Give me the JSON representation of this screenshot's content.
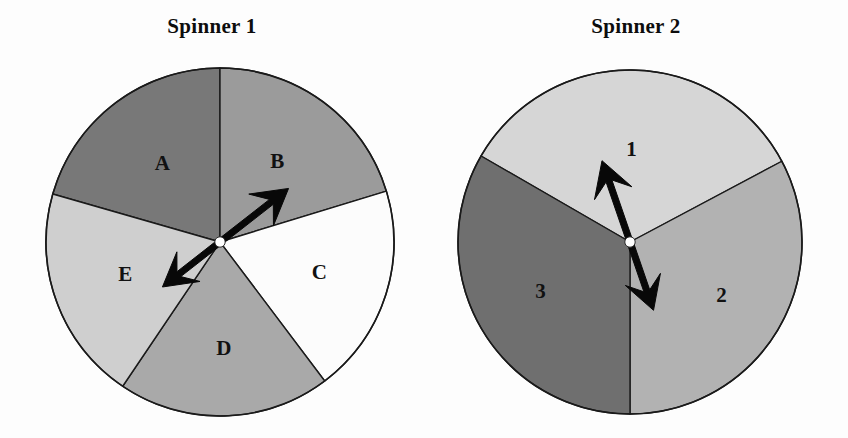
{
  "page": {
    "background_color": "#fdfdfd",
    "width": 848,
    "height": 438
  },
  "spinners": [
    {
      "id": "spinner-1",
      "title": "Spinner 1",
      "center": {
        "x": 220,
        "y": 242
      },
      "radius": 174,
      "outline_color": "#1a1a1a",
      "pointer": {
        "type": "double-headed-arrow",
        "head_angle_deg": -38,
        "tail_angle_deg": 142,
        "color": "#080808",
        "hub_color": "#ffffff"
      },
      "sectors": [
        {
          "label": "A",
          "start_deg": -90,
          "end_deg": -164,
          "fill": "#787878",
          "label_r": 0.55,
          "label_angle_deg": -127
        },
        {
          "label": "B",
          "start_deg": -90,
          "end_deg": -17,
          "fill": "#9b9b9b",
          "label_r": 0.56,
          "label_angle_deg": -54
        },
        {
          "label": "C",
          "start_deg": -17,
          "end_deg": 53,
          "fill": "#fcfcfc",
          "label_r": 0.6,
          "label_angle_deg": 18
        },
        {
          "label": "D",
          "start_deg": 53,
          "end_deg": 124,
          "fill": "#a9a9a9",
          "label_r": 0.62,
          "label_angle_deg": 88
        },
        {
          "label": "E",
          "start_deg": 124,
          "end_deg": 196,
          "fill": "#cfcfcf",
          "label_r": 0.58,
          "label_angle_deg": 160
        }
      ]
    },
    {
      "id": "spinner-2",
      "title": "Spinner 2",
      "center": {
        "x": 206,
        "y": 242
      },
      "radius": 172,
      "outline_color": "#1a1a1a",
      "pointer": {
        "type": "double-headed-arrow",
        "head_angle_deg": -109,
        "tail_angle_deg": 71,
        "color": "#080808",
        "hub_color": "#ffffff"
      },
      "sectors": [
        {
          "label": "1",
          "start_deg": -150,
          "end_deg": -28,
          "fill": "#d6d6d6",
          "label_r": 0.53,
          "label_angle_deg": -89
        },
        {
          "label": "2",
          "start_deg": -28,
          "end_deg": 90,
          "fill": "#b2b2b2",
          "label_r": 0.62,
          "label_angle_deg": 31
        },
        {
          "label": "3",
          "start_deg": 90,
          "end_deg": 210,
          "fill": "#6f6f6f",
          "label_r": 0.6,
          "label_angle_deg": 150
        }
      ]
    }
  ]
}
